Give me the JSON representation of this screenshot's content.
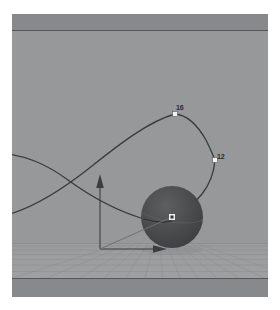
{
  "application": {
    "view_type": "3d-perspective-viewport",
    "scene_description": "Animated sphere with motion path curve and translate manipulator over a perspective ground grid"
  },
  "colors": {
    "page_background": "#ffffff",
    "viewport_background": "#96989a",
    "safe_frame_band": "#88898b",
    "safe_frame_line": "#55575a",
    "grid_floor": "#9a9c9d",
    "grid_line": "#8c8e90",
    "grid_line_bright": "#a6a8a9",
    "motion_path": "#3a3b3d",
    "keyframe_marker": "#f2f2f2",
    "keyframe_label": "#2c2c2e",
    "sphere_fill": "#4a4b4d",
    "sphere_shadow": "#3a3b3d",
    "sphere_highlight": "#5c5d5f",
    "manipulator_axis": "#3c3d3f",
    "pivot_marker": "#ededed"
  },
  "viewport": {
    "safe_frame": {
      "top_band_label": "render-safe-frame-top",
      "bottom_band_label": "render-safe-frame-bottom"
    },
    "ground": {
      "label": "perspective-ground-grid",
      "horizon_y": 229
    },
    "objects": [
      {
        "name": "sphere",
        "label": "animated-sphere-object",
        "center_x": 160,
        "center_y": 203,
        "radius": 31
      }
    ],
    "manipulator": {
      "label": "translate-manipulator",
      "origin_x": 88,
      "origin_y": 235,
      "axes": [
        {
          "name": "y-axis-arrow",
          "direction": "up"
        },
        {
          "name": "x-axis-arrow",
          "direction": "right"
        },
        {
          "name": "z-axis-arrow",
          "direction": "depth"
        }
      ]
    },
    "motion_path": {
      "label": "motion-path-curve",
      "keyframes": [
        {
          "id": "kf-16",
          "label": "16",
          "x": 163,
          "y": 100
        },
        {
          "id": "kf-12",
          "label": "12",
          "x": 203,
          "y": 146
        }
      ]
    }
  }
}
